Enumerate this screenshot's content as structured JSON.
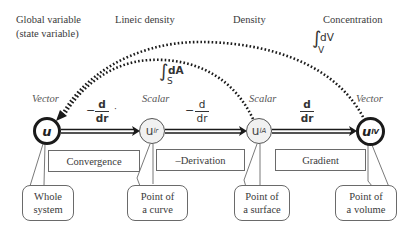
{
  "header_labels": {
    "global_line1": "Global variable",
    "global_line2": "(state variable)",
    "lineic": "Lineic density",
    "density": "Density",
    "concentration": "Concentration"
  },
  "node_types": {
    "u": "Vector",
    "ulr": "Scalar",
    "ulA": "Scalar",
    "ulV": "Vector"
  },
  "nodes": {
    "u": {
      "symbol": "u",
      "sub": ""
    },
    "ulr": {
      "symbol": "u",
      "sub": "lr"
    },
    "ulA": {
      "symbol": "u",
      "sub": "lA"
    },
    "ulV": {
      "symbol": "u",
      "sub": "lV"
    }
  },
  "operators": {
    "op1": {
      "sign": "−",
      "num": "d",
      "den": "dr",
      "suffix": "·"
    },
    "op2": {
      "sign": "−",
      "num": "d",
      "den": "dr"
    },
    "op3": {
      "num": "d",
      "den": "dr"
    },
    "integral_surface": {
      "symbol": "∫",
      "lower": "S",
      "integrand": "dA"
    },
    "integral_volume": {
      "symbol": "∫",
      "lower": "V",
      "integrand": "dV"
    }
  },
  "operation_boxes": {
    "convergence": "Convergence",
    "derivation": "–Derivation",
    "gradient": "Gradient"
  },
  "callouts": {
    "whole_system": {
      "line1": "Whole",
      "line2": "system"
    },
    "point_curve": {
      "line1": "Point of",
      "line2": "a curve"
    },
    "point_surface": {
      "line1": "Point of",
      "line2": "a surface"
    },
    "point_volume": {
      "line1": "Point of",
      "line2": "a volume"
    }
  },
  "colors": {
    "line": "#1a1a1a",
    "box_border": "#6a6a6a",
    "scalar_fill": "#f1f1f1",
    "text": "#3a3a3a"
  }
}
